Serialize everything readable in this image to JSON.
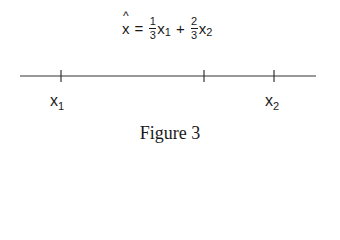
{
  "formula": {
    "lhs": "x",
    "lhs_accent": "^",
    "equals": "=",
    "term1": {
      "num": "1",
      "den": "3",
      "var": "x",
      "sub": "1"
    },
    "plus": "+",
    "term2": {
      "num": "2",
      "den": "3",
      "var": "x",
      "sub": "2"
    }
  },
  "number_line": {
    "ticks": [
      {
        "position": 61,
        "label": "x",
        "sub": "1"
      },
      {
        "position": 204,
        "label": "",
        "sub": ""
      },
      {
        "position": 274,
        "label": "x",
        "sub": "2"
      }
    ]
  },
  "labels": {
    "x1": {
      "var": "x",
      "sub": "1"
    },
    "x2": {
      "var": "x",
      "sub": "2"
    }
  },
  "caption": "Figure 3"
}
